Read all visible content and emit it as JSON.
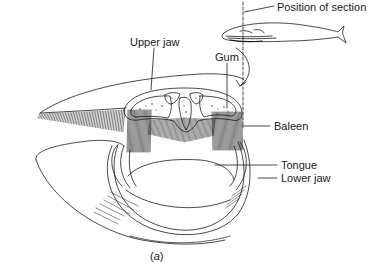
{
  "figure": {
    "caption_prefix": "(",
    "caption_letter": "a",
    "caption_suffix": ")",
    "labels": {
      "position_of_section": "Position of section",
      "upper_jaw": "Upper jaw",
      "gum": "Gum",
      "baleen": "Baleen",
      "tongue": "Tongue",
      "lower_jaw": "Lower jaw"
    },
    "colors": {
      "line": "#1a1a1a",
      "background": "#ffffff"
    }
  }
}
